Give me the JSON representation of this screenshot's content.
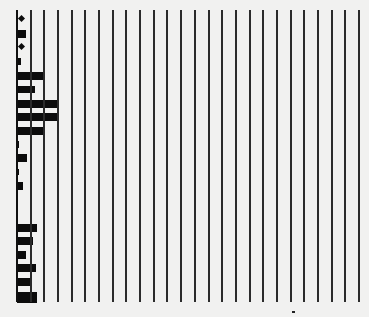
{
  "figure": {
    "background": "#f1f1f0",
    "line_color": "#2b2b2b",
    "mark_color": "#0c0c0c",
    "grid": {
      "count": 26,
      "x_start": 16,
      "x_end": 358,
      "y_top": 10,
      "y_bottom": 302
    },
    "baseline_x": 17,
    "rows": [
      {
        "y": 16,
        "kind": "dot",
        "x": 19
      },
      {
        "y": 30,
        "kind": "bar",
        "width": 9,
        "height": 8
      },
      {
        "y": 44,
        "kind": "dot",
        "x": 19
      },
      {
        "y": 58,
        "kind": "bar",
        "width": 4,
        "height": 7
      },
      {
        "y": 72,
        "kind": "bar",
        "width": 27,
        "height": 8
      },
      {
        "y": 86,
        "kind": "bar",
        "width": 18,
        "height": 7
      },
      {
        "y": 100,
        "kind": "bar",
        "width": 42,
        "height": 8
      },
      {
        "y": 113,
        "kind": "bar",
        "width": 42,
        "height": 8
      },
      {
        "y": 127,
        "kind": "bar",
        "width": 27,
        "height": 8
      },
      {
        "y": 141,
        "kind": "bar",
        "width": 2,
        "height": 7
      },
      {
        "y": 154,
        "kind": "bar",
        "width": 10,
        "height": 8
      },
      {
        "y": 169,
        "kind": "bar",
        "width": 2,
        "height": 6
      },
      {
        "y": 182,
        "kind": "bar",
        "width": 6,
        "height": 8
      },
      {
        "y": 224,
        "kind": "bar",
        "width": 20,
        "height": 8
      },
      {
        "y": 237,
        "kind": "bar",
        "width": 16,
        "height": 8
      },
      {
        "y": 251,
        "kind": "bar",
        "width": 9,
        "height": 8
      },
      {
        "y": 264,
        "kind": "bar",
        "width": 19,
        "height": 8
      },
      {
        "y": 278,
        "kind": "bar",
        "width": 14,
        "height": 8
      },
      {
        "y": 292,
        "kind": "bar",
        "width": 20,
        "height": 11
      }
    ],
    "specks": [
      {
        "x": 292,
        "y": 311
      }
    ]
  }
}
